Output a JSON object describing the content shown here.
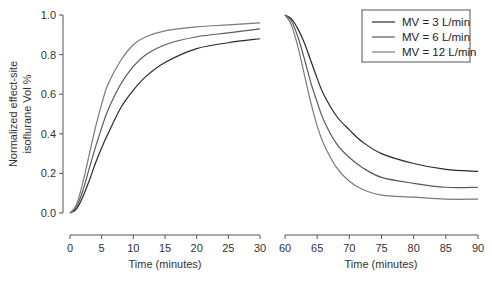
{
  "chart_data": {
    "type": "line",
    "title": "",
    "ylabel": "Normalized effect-site isoflurane Vol %",
    "ylabel_lines": [
      "Normalized effect-site",
      "isoflurane Vol %"
    ],
    "ylim": [
      0,
      1.0
    ],
    "yticks": [
      "0.0",
      "0.2",
      "0.4",
      "0.6",
      "0.8",
      "1.0"
    ],
    "grid": false,
    "legend_position": "upper right (in right panel)",
    "panels": [
      {
        "name": "wash-in",
        "xlabel": "Time (minutes)",
        "xlim": [
          0,
          30
        ],
        "xticks": [
          "0",
          "5",
          "10",
          "15",
          "20",
          "25",
          "30"
        ],
        "x": [
          0,
          1,
          2,
          3,
          4,
          5,
          6,
          8,
          10,
          12,
          15,
          20,
          25,
          30
        ],
        "series": [
          {
            "name": "MV = 3 L/min",
            "values": [
              0.0,
              0.02,
              0.08,
              0.16,
              0.25,
              0.33,
              0.4,
              0.53,
              0.62,
              0.69,
              0.76,
              0.83,
              0.86,
              0.88
            ]
          },
          {
            "name": "MV = 6 L/min",
            "values": [
              0.0,
              0.03,
              0.11,
              0.22,
              0.33,
              0.43,
              0.52,
              0.65,
              0.74,
              0.8,
              0.85,
              0.89,
              0.91,
              0.93
            ]
          },
          {
            "name": "MV = 12 L/min",
            "values": [
              0.0,
              0.04,
              0.15,
              0.29,
              0.43,
              0.55,
              0.65,
              0.77,
              0.85,
              0.89,
              0.92,
              0.94,
              0.95,
              0.96
            ]
          }
        ]
      },
      {
        "name": "wash-out",
        "xlabel": "Time (minutes)",
        "xlim": [
          60,
          90
        ],
        "xticks": [
          "60",
          "65",
          "70",
          "75",
          "80",
          "85",
          "90"
        ],
        "x": [
          60,
          61,
          62,
          63,
          64,
          65,
          66,
          68,
          70,
          72,
          75,
          80,
          85,
          90
        ],
        "series": [
          {
            "name": "MV = 3 L/min",
            "values": [
              1.0,
              0.98,
              0.93,
              0.86,
              0.77,
              0.68,
              0.6,
              0.49,
              0.42,
              0.36,
              0.3,
              0.25,
              0.22,
              0.21
            ]
          },
          {
            "name": "MV = 6 L/min",
            "values": [
              1.0,
              0.97,
              0.89,
              0.78,
              0.66,
              0.56,
              0.47,
              0.35,
              0.28,
              0.23,
              0.18,
              0.15,
              0.13,
              0.13
            ]
          },
          {
            "name": "MV = 12 L/min",
            "values": [
              1.0,
              0.95,
              0.84,
              0.7,
              0.56,
              0.44,
              0.35,
              0.23,
              0.16,
              0.12,
              0.09,
              0.08,
              0.07,
              0.07
            ]
          }
        ]
      }
    ]
  },
  "legend": {
    "entries": [
      {
        "label": "MV = 3 L/min",
        "color": "#2a2a2a"
      },
      {
        "label": "MV = 6 L/min",
        "color": "#5a5a5a"
      },
      {
        "label": "MV = 12 L/min",
        "color": "#7a7a7a"
      }
    ]
  },
  "axes": {
    "left_xlabel": "Time (minutes)",
    "right_xlabel": "Time (minutes)",
    "ylabel_line1": "Normalized effect-site",
    "ylabel_line2": "isoflurane Vol %"
  }
}
